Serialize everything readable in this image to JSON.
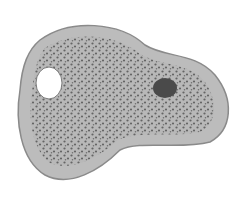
{
  "figure": {
    "parts": [
      {
        "name": "cell-membrane",
        "color": "#9a9a9a"
      },
      {
        "name": "cytoplasm",
        "color": "#b5b5b5"
      },
      {
        "name": "granules",
        "color": "#5a5a5a"
      },
      {
        "name": "vacuole",
        "color": "#ffffff"
      },
      {
        "name": "nucleus",
        "color": "#4a4a4a"
      }
    ]
  }
}
